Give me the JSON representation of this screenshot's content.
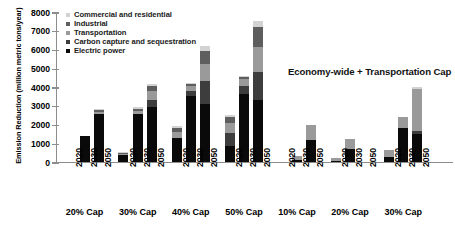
{
  "chart_data": {
    "type": "bar",
    "title": "",
    "subtitle": "",
    "xlabel": "",
    "ylabel": "Emission Reduction (million metric tons/year)",
    "ylim": [
      0,
      8000
    ],
    "ytick_values": [
      0,
      1000,
      2000,
      3000,
      4000,
      5000,
      6000,
      7000,
      8000
    ],
    "ytick_labels": [
      "0",
      "1000",
      "2000",
      "3000",
      "4000",
      "5000",
      "6000",
      "7000",
      "8000"
    ],
    "grid": false,
    "stacked": true,
    "legend_position": "top-left",
    "annotations": [
      {
        "text": "Economy-wide + Transportation Cap",
        "x_px": 288,
        "y_px": 66
      }
    ],
    "series": [
      {
        "name": "Commercial and residential",
        "color": "#d2d2d2",
        "key": "cr"
      },
      {
        "name": "Industrial",
        "color": "#5e5e5e",
        "key": "ind"
      },
      {
        "name": "Transportation",
        "color": "#9a9a9a",
        "key": "tr"
      },
      {
        "name": "Carbon capture and sequestration",
        "color": "#3d3d3d",
        "key": "ccs"
      },
      {
        "name": "Electric power",
        "color": "#0a0a0a",
        "key": "ep"
      }
    ],
    "groups": [
      {
        "label": "20% Cap",
        "scenario": "Economy-wide Cap",
        "bars": [
          {
            "year": "2020",
            "total": 0,
            "values": {
              "ep": 0,
              "ccs": 0,
              "tr": 0,
              "ind": 0,
              "cr": 0
            }
          },
          {
            "year": "2030",
            "total": 1400,
            "values": {
              "ep": 1400,
              "ccs": 0,
              "tr": 0,
              "ind": 0,
              "cr": 0
            }
          },
          {
            "year": "2050",
            "total": 2800,
            "values": {
              "ep": 2550,
              "ccs": 0,
              "tr": 120,
              "ind": 80,
              "cr": 50
            }
          }
        ]
      },
      {
        "label": "30% Cap",
        "scenario": "Economy-wide Cap",
        "bars": [
          {
            "year": "2020",
            "total": 500,
            "values": {
              "ep": 350,
              "ccs": 0,
              "tr": 90,
              "ind": 40,
              "cr": 20
            }
          },
          {
            "year": "2030",
            "total": 2900,
            "values": {
              "ep": 2550,
              "ccs": 0,
              "tr": 180,
              "ind": 100,
              "cr": 70
            }
          },
          {
            "year": "2050",
            "total": 4150,
            "values": {
              "ep": 2900,
              "ccs": 400,
              "tr": 500,
              "ind": 250,
              "cr": 100
            }
          }
        ]
      },
      {
        "label": "40% Cap",
        "scenario": "Economy-wide Cap",
        "bars": [
          {
            "year": "2020",
            "total": 1900,
            "values": {
              "ep": 1250,
              "ccs": 0,
              "tr": 350,
              "ind": 200,
              "cr": 100
            }
          },
          {
            "year": "2030",
            "total": 4200,
            "values": {
              "ep": 3500,
              "ccs": 300,
              "tr": 250,
              "ind": 100,
              "cr": 50
            }
          },
          {
            "year": "2050",
            "total": 6200,
            "values": {
              "ep": 3100,
              "ccs": 1200,
              "tr": 900,
              "ind": 700,
              "cr": 300
            }
          }
        ]
      },
      {
        "label": "50% Cap",
        "scenario": "Economy-wide Cap",
        "bars": [
          {
            "year": "2020",
            "total": 2500,
            "values": {
              "ep": 850,
              "ccs": 700,
              "tr": 500,
              "ind": 350,
              "cr": 100
            }
          },
          {
            "year": "2030",
            "total": 4600,
            "values": {
              "ep": 3600,
              "ccs": 450,
              "tr": 350,
              "ind": 150,
              "cr": 50
            }
          },
          {
            "year": "2050",
            "total": 7500,
            "values": {
              "ep": 3300,
              "ccs": 1500,
              "tr": 1300,
              "ind": 1100,
              "cr": 300
            }
          }
        ]
      },
      {
        "label": "10% Cap",
        "scenario": "Economy-wide + Transportation Cap",
        "bars": [
          {
            "year": "2020",
            "total": 0,
            "values": {
              "ep": 0,
              "ccs": 0,
              "tr": 0,
              "ind": 0,
              "cr": 0
            }
          },
          {
            "year": "2030",
            "total": 300,
            "values": {
              "ep": 120,
              "ccs": 0,
              "tr": 180,
              "ind": 0,
              "cr": 0
            }
          },
          {
            "year": "2050",
            "total": 1950,
            "values": {
              "ep": 1150,
              "ccs": 0,
              "tr": 800,
              "ind": 0,
              "cr": 0
            }
          }
        ]
      },
      {
        "label": "20% Cap",
        "scenario": "Economy-wide + Transportation Cap",
        "bars": [
          {
            "year": "2020",
            "total": 200,
            "values": {
              "ep": 50,
              "ccs": 0,
              "tr": 150,
              "ind": 0,
              "cr": 0
            }
          },
          {
            "year": "2030",
            "total": 1200,
            "values": {
              "ep": 700,
              "ccs": 0,
              "tr": 500,
              "ind": 0,
              "cr": 0
            }
          },
          {
            "year": "2050",
            "total": 0,
            "values": {
              "ep": 0,
              "ccs": 0,
              "tr": 0,
              "ind": 0,
              "cr": 0
            }
          }
        ]
      },
      {
        "label": "30% Cap",
        "scenario": "Economy-wide + Transportation Cap",
        "bars": [
          {
            "year": "2020",
            "total": 650,
            "values": {
              "ep": 250,
              "ccs": 0,
              "tr": 400,
              "ind": 0,
              "cr": 0
            }
          },
          {
            "year": "2030",
            "total": 2400,
            "values": {
              "ep": 1800,
              "ccs": 0,
              "tr": 600,
              "ind": 0,
              "cr": 0
            }
          },
          {
            "year": "2050",
            "total": 4000,
            "values": {
              "ep": 1500,
              "ccs": 150,
              "tr": 2250,
              "ind": 0,
              "cr": 100
            }
          }
        ]
      }
    ]
  }
}
